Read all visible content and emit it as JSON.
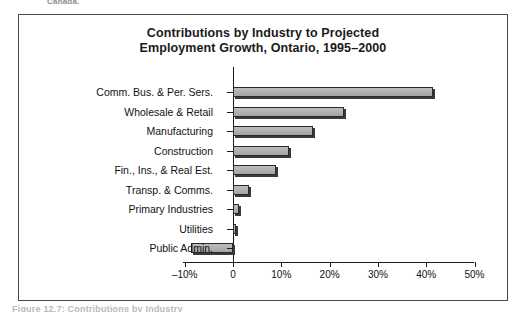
{
  "page": {
    "top_clipped_text": "Canada.",
    "bottom_clipped_text": "Figure 12.7: Contributions by Industry"
  },
  "figure": {
    "title_line_1": "Contributions by Industry to Projected",
    "title_line_2": "Employment Growth, Ontario, 1995–2000"
  },
  "chart_data": {
    "type": "bar",
    "orientation": "horizontal",
    "title": "Contributions by Industry to Projected Employment Growth, Ontario, 1995–2000",
    "xlabel": "",
    "ylabel": "",
    "xlim": [
      -10,
      50
    ],
    "xticks": [
      -10,
      0,
      10,
      20,
      30,
      40,
      50
    ],
    "xticklabels": [
      "–10%",
      "0",
      "10%",
      "20%",
      "30%",
      "40%",
      "50%"
    ],
    "grid": false,
    "legend": "none",
    "bar_color": "#b2b2b2",
    "bar_edge_color": "#2a2a2a",
    "categories": [
      "Comm. Bus. & Per. Sers.",
      "Wholesale & Retail",
      "Manufacturing",
      "Construction",
      "Fin., Ins., & Real Est.",
      "Transp. & Comms.",
      "Primary Industries",
      "Utilities",
      "Public Admin."
    ],
    "values": [
      41.5,
      23.0,
      16.5,
      11.5,
      9.0,
      3.3,
      1.3,
      0.6,
      -8.7
    ]
  }
}
